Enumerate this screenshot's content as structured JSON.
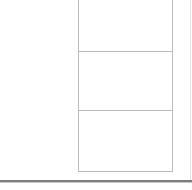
{
  "canvas": {
    "width": 192,
    "height": 190,
    "background_color": "#ffffff",
    "description": "Cropped fragment of a document or form showing three stacked empty rectangular panels on the right side, blank white margin on the left, and a horizontal rule near the bottom."
  },
  "colors": {
    "background": "#ffffff",
    "panel_border": "#bcbcbc",
    "panel_fill": "#ffffff",
    "bottom_rule": "#7d7d7d",
    "bottom_rule_shadow": "#c9c9c9",
    "right_edge_rule": "#e2e2e2"
  },
  "left_gutter": {
    "label": "",
    "content": ""
  },
  "panel_column": {
    "label": "",
    "panels": [
      {
        "label": "",
        "content": "",
        "clipped_at_top": true
      },
      {
        "label": "",
        "content": "",
        "clipped_at_top": false
      },
      {
        "label": "",
        "content": "",
        "clipped_at_top": false
      }
    ]
  },
  "rules": {
    "bottom_rule_label": "",
    "right_edge_rule_label": ""
  },
  "footer": {
    "text": ""
  }
}
